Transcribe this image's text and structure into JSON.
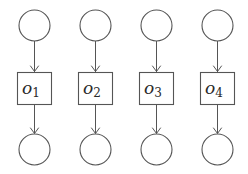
{
  "diagram": {
    "type": "graphical-model",
    "stroke_color": "#555555",
    "background": "#ffffff",
    "columns": [
      {
        "top_node": "circle",
        "middle_label_base": "o",
        "middle_label_sub": "1",
        "bottom_node": "circle"
      },
      {
        "top_node": "circle",
        "middle_label_base": "o",
        "middle_label_sub": "2",
        "bottom_node": "circle"
      },
      {
        "top_node": "circle",
        "middle_label_base": "o",
        "middle_label_sub": "3",
        "bottom_node": "circle"
      },
      {
        "top_node": "circle",
        "middle_label_base": "o",
        "middle_label_sub": "4",
        "bottom_node": "circle"
      }
    ],
    "edges": [
      {
        "from": "top-circle-1",
        "to": "box-o1"
      },
      {
        "from": "box-o1",
        "to": "bottom-circle-1"
      },
      {
        "from": "top-circle-2",
        "to": "box-o2"
      },
      {
        "from": "box-o2",
        "to": "bottom-circle-2"
      },
      {
        "from": "top-circle-3",
        "to": "box-o3"
      },
      {
        "from": "box-o3",
        "to": "bottom-circle-3"
      },
      {
        "from": "top-circle-4",
        "to": "box-o4"
      },
      {
        "from": "box-o4",
        "to": "bottom-circle-4"
      }
    ]
  }
}
